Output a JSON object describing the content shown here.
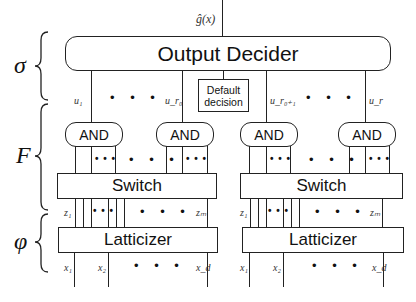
{
  "output": {
    "label": "ĝ(x)"
  },
  "output_decider": {
    "label": "Output Decider"
  },
  "default_decision": {
    "label_line1": "Default",
    "label_line2": "decision"
  },
  "layers": {
    "sigma": "σ",
    "F": "F",
    "phi": "φ"
  },
  "u_labels": {
    "u1": "u₁",
    "ur0": "u_r₀",
    "ur0p1": "u_r₀₊₁",
    "ur": "u_r"
  },
  "and_label": "AND",
  "switch_label": "Switch",
  "latticizer_label": "Latticizer",
  "z_labels": {
    "z1": "z₁",
    "zm": "zₘ"
  },
  "x_labels": {
    "x1": "x₁",
    "x2": "x₂",
    "xd": "x_d"
  },
  "ellipsis": "• • •",
  "small_ellipsis": "• • •"
}
